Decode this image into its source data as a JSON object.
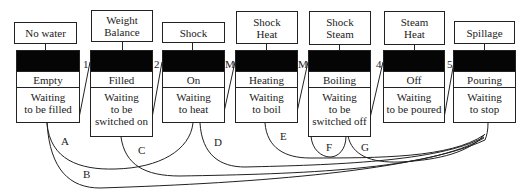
{
  "stages": [
    {
      "event": "No water",
      "state": "Empty",
      "waiting": "Waiting\nto be filled"
    },
    {
      "event": "Weight\nBalance",
      "state": "Filled",
      "waiting": "Waiting\nto be\nswitched on"
    },
    {
      "event": "Shock",
      "state": "On",
      "waiting": "Waiting\nto heat"
    },
    {
      "event": "Shock\nHeat",
      "state": "Heating",
      "waiting": "Waiting\nto boil"
    },
    {
      "event": "Shock\nSteam",
      "state": "Boiling",
      "waiting": "Waiting\nto be\nswitched off"
    },
    {
      "event": "Steam\nHeat",
      "state": "Off",
      "waiting": "Waiting\nto be poured"
    },
    {
      "event": "Spillage",
      "state": "Pouring",
      "waiting": "Waiting\nto stop"
    }
  ],
  "transitions": [
    "1",
    "2",
    "M",
    "M",
    "4",
    "5"
  ],
  "arcs": [
    "A",
    "B",
    "C",
    "D",
    "E",
    "F",
    "G"
  ]
}
